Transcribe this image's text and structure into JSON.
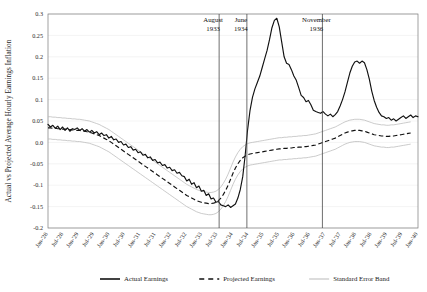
{
  "chart_data": {
    "type": "line",
    "title": "",
    "xlabel": "",
    "ylabel": "Actual vs Projected Average Hourly Earnings Inflation",
    "ylim": [
      -0.2,
      0.3
    ],
    "xlim": [
      "Jan-'28",
      "Jan-'40"
    ],
    "grid": true,
    "legend_position": "bottom",
    "ytick_labels": [
      "0.3",
      "0.25",
      "0.2",
      "0.15",
      "0.1",
      "0.05",
      "0.0",
      "-0.05",
      "-0.1",
      "-0.15",
      "-0.2"
    ],
    "ytick_values": [
      0.3,
      0.25,
      0.2,
      0.15,
      0.1,
      0.05,
      0.0,
      -0.05,
      -0.1,
      -0.15,
      -0.2
    ],
    "xtick_labels": [
      "Jan-'28",
      "Jul-'28",
      "Jan-'29",
      "Jul-'29",
      "Jan-'30",
      "Jul-'30",
      "Jan-'31",
      "Jul-'31",
      "Jan-'32",
      "Jul-'32",
      "Jan-'33",
      "Jul-'33",
      "Jan-'34",
      "Jul-'34",
      "Jan-'35",
      "Jul-'35",
      "Jan-'36",
      "Jul-'36",
      "Jan-'37",
      "Jul-'37",
      "Jan-'38",
      "Jul-'38",
      "Jan-'39",
      "Jul-'39",
      "Jan-'40"
    ],
    "annotations": [
      {
        "label_line1": "August",
        "label_line2": "1933",
        "x_label": "Jul-'33",
        "x_index": 11.1
      },
      {
        "label_line1": "June",
        "label_line2": "1934",
        "x_label": "Jul-'34",
        "x_index": 12.9
      },
      {
        "label_line1": "November",
        "label_line2": "1936",
        "x_label": "Jan-'37",
        "x_index": 17.8
      }
    ],
    "series": [
      {
        "name": "Actual Earnings",
        "style": "solid",
        "color": "#111111",
        "values": [
          0.042,
          0.036,
          0.04,
          0.033,
          0.038,
          0.03,
          0.036,
          0.028,
          0.034,
          0.026,
          0.032,
          0.03,
          0.034,
          0.028,
          0.032,
          0.026,
          0.03,
          0.024,
          0.028,
          0.022,
          0.025,
          0.018,
          0.022,
          0.016,
          0.018,
          0.01,
          0.014,
          0.006,
          0.008,
          0.0,
          0.002,
          -0.006,
          -0.004,
          -0.012,
          -0.01,
          -0.018,
          -0.016,
          -0.024,
          -0.022,
          -0.03,
          -0.028,
          -0.036,
          -0.034,
          -0.042,
          -0.04,
          -0.048,
          -0.046,
          -0.054,
          -0.052,
          -0.06,
          -0.058,
          -0.066,
          -0.064,
          -0.072,
          -0.07,
          -0.078,
          -0.08,
          -0.09,
          -0.086,
          -0.098,
          -0.094,
          -0.106,
          -0.102,
          -0.114,
          -0.112,
          -0.124,
          -0.12,
          -0.132,
          -0.13,
          -0.14,
          -0.138,
          -0.146,
          -0.148,
          -0.15,
          -0.146,
          -0.152,
          -0.148,
          -0.144,
          -0.13,
          -0.11,
          -0.08,
          -0.03,
          0.03,
          0.075,
          0.105,
          0.125,
          0.14,
          0.155,
          0.175,
          0.195,
          0.215,
          0.24,
          0.268,
          0.285,
          0.29,
          0.27,
          0.235,
          0.2,
          0.185,
          0.182,
          0.17,
          0.155,
          0.145,
          0.128,
          0.11,
          0.105,
          0.095,
          0.098,
          0.088,
          0.075,
          0.072,
          0.07,
          0.068,
          0.072,
          0.066,
          0.062,
          0.066,
          0.06,
          0.065,
          0.072,
          0.085,
          0.1,
          0.118,
          0.14,
          0.162,
          0.178,
          0.188,
          0.19,
          0.185,
          0.19,
          0.186,
          0.17,
          0.148,
          0.12,
          0.098,
          0.082,
          0.07,
          0.062,
          0.06,
          0.056,
          0.058,
          0.052,
          0.055,
          0.05,
          0.054,
          0.058,
          0.062,
          0.056,
          0.06,
          0.064,
          0.058,
          0.062,
          0.06
        ]
      },
      {
        "name": "Projected Earnings",
        "style": "dashed",
        "color": "#111111",
        "values": [
          0.034,
          0.034,
          0.033,
          0.033,
          0.032,
          0.032,
          0.031,
          0.031,
          0.03,
          0.03,
          0.029,
          0.029,
          0.028,
          0.028,
          0.027,
          0.026,
          0.025,
          0.024,
          0.022,
          0.02,
          0.018,
          0.016,
          0.013,
          0.01,
          0.007,
          0.004,
          0.0,
          -0.004,
          -0.008,
          -0.012,
          -0.016,
          -0.02,
          -0.024,
          -0.028,
          -0.032,
          -0.036,
          -0.04,
          -0.044,
          -0.048,
          -0.052,
          -0.056,
          -0.06,
          -0.064,
          -0.068,
          -0.072,
          -0.076,
          -0.08,
          -0.084,
          -0.088,
          -0.092,
          -0.096,
          -0.1,
          -0.104,
          -0.108,
          -0.112,
          -0.116,
          -0.12,
          -0.124,
          -0.127,
          -0.13,
          -0.133,
          -0.136,
          -0.138,
          -0.14,
          -0.141,
          -0.142,
          -0.143,
          -0.143,
          -0.142,
          -0.14,
          -0.136,
          -0.13,
          -0.122,
          -0.112,
          -0.1,
          -0.086,
          -0.072,
          -0.06,
          -0.05,
          -0.042,
          -0.036,
          -0.032,
          -0.029,
          -0.027,
          -0.026,
          -0.025,
          -0.024,
          -0.023,
          -0.022,
          -0.021,
          -0.02,
          -0.019,
          -0.018,
          -0.017,
          -0.016,
          -0.015,
          -0.015,
          -0.014,
          -0.014,
          -0.013,
          -0.013,
          -0.012,
          -0.012,
          -0.011,
          -0.011,
          -0.01,
          -0.01,
          -0.009,
          -0.008,
          -0.007,
          -0.006,
          -0.004,
          -0.002,
          0.0,
          0.002,
          0.004,
          0.006,
          0.008,
          0.01,
          0.013,
          0.016,
          0.019,
          0.022,
          0.024,
          0.026,
          0.027,
          0.028,
          0.028,
          0.028,
          0.027,
          0.026,
          0.024,
          0.022,
          0.02,
          0.018,
          0.017,
          0.016,
          0.015,
          0.015,
          0.014,
          0.014,
          0.015,
          0.015,
          0.016,
          0.017,
          0.018,
          0.019,
          0.02,
          0.021,
          0.022
        ]
      },
      {
        "name": "Standard Error Band",
        "style": "thin-gray",
        "color": "#b9b9b9",
        "band_offset": 0.026
      }
    ],
    "legend": [
      {
        "label": "Actual Earnings",
        "style": "solid",
        "color": "#111111"
      },
      {
        "label": "Projected Earnings",
        "style": "dashed",
        "color": "#111111"
      },
      {
        "label": "Standard Error Band",
        "style": "thin-gray",
        "color": "#b9b9b9"
      }
    ]
  }
}
